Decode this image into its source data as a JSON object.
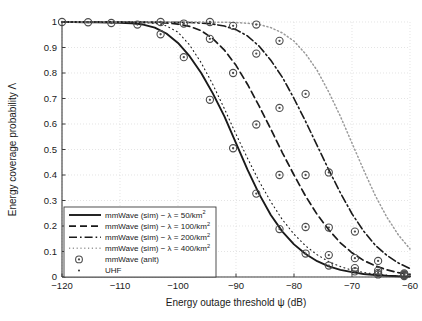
{
  "chart_data": {
    "type": "line",
    "title": "",
    "xlabel": "Energy outage threshold ψ (dB)",
    "ylabel": "Energy coverage probability Λ",
    "xlim": [
      -120,
      -60
    ],
    "ylim": [
      0,
      1
    ],
    "xticks": [
      -120,
      -110,
      -100,
      -90,
      -80,
      -70,
      -60
    ],
    "xticklabels": [
      "−120",
      "−110",
      "−100",
      "−90",
      "−80",
      "−70",
      "−60"
    ],
    "yticks": [
      0,
      0.1,
      0.2,
      0.3,
      0.4,
      0.5,
      0.6,
      0.7,
      0.8,
      0.9,
      1
    ],
    "yticklabels": [
      "0",
      "0.1",
      "0.2",
      "0.3",
      "0.4",
      "0.5",
      "0.6",
      "0.7",
      "0.8",
      "0.9",
      "1"
    ],
    "grid": true,
    "grid_style": "dotted",
    "legend_position": "lower-left",
    "series": [
      {
        "name": "mmWave (sim) − λ = 50/km",
        "name_sup": "2",
        "style": "solid",
        "color": "#1a1a1a",
        "x": [
          -120,
          -118,
          -116,
          -114,
          -112,
          -110,
          -108,
          -106,
          -104,
          -102,
          -100,
          -98,
          -96,
          -94,
          -92,
          -90,
          -88,
          -86,
          -84,
          -82,
          -80,
          -78,
          -76,
          -74,
          -72,
          -70,
          -68,
          -66,
          -64,
          -62,
          -60
        ],
        "y": [
          1.0,
          1.0,
          0.999,
          0.999,
          0.998,
          0.997,
          0.995,
          0.99,
          0.978,
          0.955,
          0.918,
          0.866,
          0.8,
          0.72,
          0.63,
          0.525,
          0.42,
          0.325,
          0.243,
          0.178,
          0.128,
          0.09,
          0.062,
          0.042,
          0.028,
          0.019,
          0.012,
          0.008,
          0.005,
          0.003,
          0.002
        ]
      },
      {
        "name": "mmWave (sim) − λ = 100/km",
        "name_sup": "2",
        "style": "dashed",
        "color": "#1a1a1a",
        "x": [
          -120,
          -118,
          -116,
          -114,
          -112,
          -110,
          -108,
          -106,
          -104,
          -102,
          -100,
          -98,
          -96,
          -94,
          -92,
          -90,
          -88,
          -86,
          -84,
          -82,
          -80,
          -78,
          -76,
          -74,
          -72,
          -70,
          -68,
          -66,
          -64,
          -62,
          -60
        ],
        "y": [
          1.0,
          1.0,
          1.0,
          1.0,
          1.0,
          1.0,
          0.999,
          0.999,
          0.998,
          0.996,
          0.992,
          0.983,
          0.966,
          0.935,
          0.89,
          0.83,
          0.755,
          0.67,
          0.58,
          0.487,
          0.4,
          0.317,
          0.245,
          0.185,
          0.134,
          0.095,
          0.065,
          0.044,
          0.028,
          0.017,
          0.01
        ]
      },
      {
        "name": "mmWave (sim) − λ = 200/km",
        "name_sup": "2",
        "style": "dashdot",
        "color": "#1a1a1a",
        "x": [
          -120,
          -118,
          -116,
          -114,
          -112,
          -110,
          -108,
          -106,
          -104,
          -102,
          -100,
          -98,
          -96,
          -94,
          -92,
          -90,
          -88,
          -86,
          -84,
          -82,
          -80,
          -78,
          -76,
          -74,
          -72,
          -70,
          -68,
          -66,
          -64,
          -62,
          -60
        ],
        "y": [
          1.0,
          1.0,
          1.0,
          1.0,
          1.0,
          1.0,
          1.0,
          1.0,
          1.0,
          0.999,
          0.999,
          0.998,
          0.996,
          0.992,
          0.984,
          0.97,
          0.945,
          0.905,
          0.85,
          0.783,
          0.7,
          0.61,
          0.515,
          0.42,
          0.33,
          0.248,
          0.18,
          0.125,
          0.085,
          0.055,
          0.033
        ]
      },
      {
        "name": "mmWave (sim) − λ = 400/km",
        "name_sup": "2",
        "style": "dotted",
        "color": "#9a9a9a",
        "x": [
          -120,
          -118,
          -116,
          -114,
          -112,
          -110,
          -108,
          -106,
          -104,
          -102,
          -100,
          -98,
          -96,
          -94,
          -92,
          -90,
          -88,
          -86,
          -84,
          -82,
          -80,
          -78,
          -76,
          -74,
          -72,
          -70,
          -68,
          -66,
          -64,
          -62,
          -60
        ],
        "y": [
          1.0,
          1.0,
          1.0,
          1.0,
          1.0,
          1.0,
          1.0,
          1.0,
          1.0,
          1.0,
          1.0,
          1.0,
          1.0,
          0.999,
          0.999,
          0.998,
          0.995,
          0.99,
          0.978,
          0.957,
          0.925,
          0.875,
          0.81,
          0.725,
          0.63,
          0.525,
          0.42,
          0.32,
          0.235,
          0.165,
          0.11
        ]
      },
      {
        "name": "UHF",
        "style": "fine-dotted",
        "color": "#1a1a1a",
        "x": [
          -120,
          -116,
          -112,
          -108,
          -104,
          -102,
          -100,
          -98,
          -96,
          -94,
          -92,
          -90,
          -88,
          -86,
          -84,
          -82,
          -80,
          -78,
          -76,
          -74,
          -72,
          -70,
          -68,
          -66,
          -64,
          -62,
          -60
        ],
        "y": [
          1.0,
          1.0,
          1.0,
          0.999,
          0.995,
          0.985,
          0.96,
          0.91,
          0.84,
          0.755,
          0.66,
          0.56,
          0.465,
          0.375,
          0.295,
          0.225,
          0.168,
          0.122,
          0.087,
          0.06,
          0.041,
          0.027,
          0.018,
          0.011,
          0.007,
          0.004,
          0.002
        ]
      }
    ],
    "markers": {
      "name": "mmWave (anlt)",
      "symbol": "circle-dot",
      "color": "#4d4d4d",
      "sets": [
        {
          "series": "mmWave (sim) − λ = 50/km2",
          "x": [
            -120,
            -115.5,
            -111.5,
            -107,
            -103,
            -99,
            -94.5,
            -90.5,
            -86.5,
            -82.5,
            -78,
            -74,
            -69.5,
            -65.5,
            -61
          ],
          "y": [
            1.0,
            0.999,
            0.996,
            0.99,
            0.952,
            0.862,
            0.695,
            0.505,
            0.327,
            0.188,
            0.092,
            0.045,
            0.022,
            0.01,
            0.004
          ]
        },
        {
          "series": "mmWave (sim) − λ = 100/km2",
          "x": [
            -103,
            -99,
            -94.5,
            -90.5,
            -86.5,
            -82.5,
            -78,
            -74,
            -69.5,
            -65.5,
            -61
          ],
          "y": [
            1.0,
            0.994,
            0.934,
            0.8,
            0.598,
            0.4,
            0.196,
            0.086,
            0.035,
            0.016,
            0.008
          ]
        },
        {
          "series": "mmWave (sim) − λ = 200/km2",
          "x": [
            -94.5,
            -90.5,
            -86.5,
            -82.5,
            -78,
            -74,
            -69.5,
            -65.5,
            -61
          ],
          "y": [
            1.0,
            0.985,
            0.876,
            0.663,
            0.4,
            0.194,
            0.074,
            0.025,
            0.01
          ]
        },
        {
          "series": "mmWave (sim) − λ = 400/km2",
          "x": [
            -86.5,
            -82.5,
            -78,
            -74,
            -69.5,
            -65.5,
            -61
          ],
          "y": [
            0.99,
            0.926,
            0.718,
            0.41,
            0.178,
            0.063,
            0.014
          ]
        }
      ]
    }
  },
  "legend": {
    "items": [
      {
        "label": "mmWave (sim) − λ = 50/km",
        "sup": "2",
        "style": "solid",
        "kind": "line"
      },
      {
        "label": "mmWave (sim) − λ = 100/km",
        "sup": "2",
        "style": "dashed",
        "kind": "line"
      },
      {
        "label": "mmWave (sim) − λ = 200/km",
        "sup": "2",
        "style": "dashdot",
        "kind": "line"
      },
      {
        "label": "mmWave (sim) − λ = 400/km",
        "sup": "2",
        "style": "dotted",
        "kind": "line"
      },
      {
        "label": "mmWave (anlt)",
        "sup": "",
        "style": "circle-dot",
        "kind": "marker"
      },
      {
        "label": "UHF",
        "sup": "",
        "style": "fine-dotted",
        "kind": "marker-small"
      }
    ]
  },
  "colors": {
    "axis": "#3c3c3c",
    "grid": "#d9d9d9",
    "text": "#1a1a1a",
    "marker": "#4d4d4d",
    "light_series": "#9a9a9a",
    "background": "#ffffff"
  }
}
